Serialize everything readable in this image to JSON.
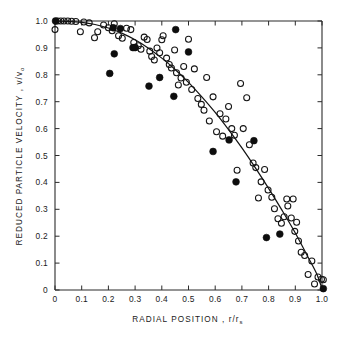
{
  "figure": {
    "background_color": "#ffffff",
    "ink_color": "#141414"
  },
  "chart_data": {
    "type": "scatter",
    "title": "",
    "xlabel": "RADIAL POSITION, r/r",
    "xlabel_main": "RADIAL POSITION ,",
    "xlabel_symbol": "r/r",
    "xlabel_subscript": "s",
    "ylabel_main": "REDUCED PARTICLE VELOCITY ,",
    "ylabel_symbol": "v/v",
    "ylabel_subscript": "o",
    "ylabel": "REDUCED PARTICLE VELOCITY, v/v_o",
    "xlim": [
      0,
      1.0
    ],
    "ylim": [
      0,
      1.0
    ],
    "grid": false,
    "legend": "none",
    "xticks": [
      0,
      0.1,
      0.2,
      0.3,
      0.4,
      0.5,
      0.6,
      0.7,
      0.8,
      0.9,
      1.0
    ],
    "xtick_labels": [
      "0",
      "0.1",
      "0.2",
      "0.3",
      "0.4",
      "0.5",
      "0.6",
      "0.7",
      "0.8",
      "0.9",
      "1.0"
    ],
    "yticks": [
      0,
      0.1,
      0.2,
      0.3,
      0.4,
      0.5,
      0.6,
      0.7,
      0.8,
      0.9,
      1.0
    ],
    "ytick_labels": [
      "0",
      "0.1",
      "0.2",
      "0.3",
      "0.4",
      "0.5",
      "0.6",
      "0.7",
      "0.8",
      "0.9",
      "1.0"
    ],
    "series": [
      {
        "name": "open-circles",
        "marker": "open circle",
        "marker_radius_px": 3.0,
        "color": "#141414",
        "points": [
          [
            0.0,
            0.968
          ],
          [
            0.01,
            1.0
          ],
          [
            0.022,
            1.0
          ],
          [
            0.034,
            1.0
          ],
          [
            0.048,
            1.0
          ],
          [
            0.062,
            0.999
          ],
          [
            0.078,
            0.998
          ],
          [
            0.095,
            0.96
          ],
          [
            0.108,
            0.996
          ],
          [
            0.128,
            0.993
          ],
          [
            0.148,
            0.938
          ],
          [
            0.16,
            0.96
          ],
          [
            0.182,
            0.985
          ],
          [
            0.2,
            0.975
          ],
          [
            0.214,
            0.964
          ],
          [
            0.222,
            0.99
          ],
          [
            0.238,
            0.945
          ],
          [
            0.252,
            0.936
          ],
          [
            0.268,
            0.973
          ],
          [
            0.284,
            0.968
          ],
          [
            0.295,
            0.92
          ],
          [
            0.3,
            0.901
          ],
          [
            0.312,
            0.908
          ],
          [
            0.322,
            0.895
          ],
          [
            0.334,
            0.94
          ],
          [
            0.345,
            0.931
          ],
          [
            0.355,
            0.888
          ],
          [
            0.362,
            0.868
          ],
          [
            0.372,
            0.855
          ],
          [
            0.382,
            0.9
          ],
          [
            0.392,
            0.882
          ],
          [
            0.4,
            0.93
          ],
          [
            0.405,
            0.945
          ],
          [
            0.418,
            0.862
          ],
          [
            0.428,
            0.838
          ],
          [
            0.436,
            0.825
          ],
          [
            0.448,
            0.892
          ],
          [
            0.455,
            0.808
          ],
          [
            0.462,
            0.762
          ],
          [
            0.472,
            0.788
          ],
          [
            0.482,
            0.831
          ],
          [
            0.492,
            0.772
          ],
          [
            0.5,
            0.932
          ],
          [
            0.512,
            0.745
          ],
          [
            0.522,
            0.822
          ],
          [
            0.535,
            0.712
          ],
          [
            0.548,
            0.69
          ],
          [
            0.558,
            0.668
          ],
          [
            0.568,
            0.79
          ],
          [
            0.578,
            0.628
          ],
          [
            0.592,
            0.718
          ],
          [
            0.605,
            0.588
          ],
          [
            0.618,
            0.655
          ],
          [
            0.628,
            0.572
          ],
          [
            0.64,
            0.636
          ],
          [
            0.65,
            0.682
          ],
          [
            0.662,
            0.6
          ],
          [
            0.672,
            0.575
          ],
          [
            0.682,
            0.445
          ],
          [
            0.695,
            0.768
          ],
          [
            0.705,
            0.6
          ],
          [
            0.718,
            0.715
          ],
          [
            0.728,
            0.54
          ],
          [
            0.742,
            0.472
          ],
          [
            0.752,
            0.455
          ],
          [
            0.762,
            0.342
          ],
          [
            0.772,
            0.402
          ],
          [
            0.785,
            0.448
          ],
          [
            0.798,
            0.372
          ],
          [
            0.812,
            0.345
          ],
          [
            0.822,
            0.302
          ],
          [
            0.835,
            0.265
          ],
          [
            0.848,
            0.248
          ],
          [
            0.858,
            0.272
          ],
          [
            0.868,
            0.338
          ],
          [
            0.872,
            0.312
          ],
          [
            0.885,
            0.268
          ],
          [
            0.892,
            0.338
          ],
          [
            0.898,
            0.218
          ],
          [
            0.905,
            0.252
          ],
          [
            0.912,
            0.182
          ],
          [
            0.922,
            0.14
          ],
          [
            0.935,
            0.128
          ],
          [
            0.948,
            0.058
          ],
          [
            0.962,
            0.108
          ],
          [
            0.972,
            0.022
          ],
          [
            0.985,
            0.048
          ],
          [
            0.998,
            0.04
          ],
          [
            1.005,
            0.038
          ]
        ]
      },
      {
        "name": "filled-circles",
        "marker": "filled circle",
        "marker_radius_px": 3.4,
        "color": "#0d0d0d",
        "points": [
          [
            0.002,
            1.0
          ],
          [
            0.205,
            0.805
          ],
          [
            0.218,
            0.975
          ],
          [
            0.222,
            0.878
          ],
          [
            0.245,
            0.972
          ],
          [
            0.292,
            0.901
          ],
          [
            0.3,
            0.902
          ],
          [
            0.352,
            0.758
          ],
          [
            0.392,
            0.79
          ],
          [
            0.445,
            0.72
          ],
          [
            0.452,
            0.968
          ],
          [
            0.5,
            0.885
          ],
          [
            0.592,
            0.515
          ],
          [
            0.652,
            0.558
          ],
          [
            0.678,
            0.402
          ],
          [
            0.745,
            0.555
          ],
          [
            0.792,
            0.195
          ],
          [
            0.842,
            0.208
          ],
          [
            1.005,
            0.005
          ]
        ]
      }
    ],
    "fit_curve": {
      "name": "fitted-curve",
      "color": "#141414",
      "points": [
        [
          0.0,
          1.0
        ],
        [
          0.05,
          0.999
        ],
        [
          0.1,
          0.995
        ],
        [
          0.15,
          0.987
        ],
        [
          0.2,
          0.974
        ],
        [
          0.25,
          0.955
        ],
        [
          0.3,
          0.93
        ],
        [
          0.35,
          0.899
        ],
        [
          0.4,
          0.862
        ],
        [
          0.45,
          0.82
        ],
        [
          0.5,
          0.772
        ],
        [
          0.55,
          0.718
        ],
        [
          0.6,
          0.66
        ],
        [
          0.65,
          0.596
        ],
        [
          0.7,
          0.528
        ],
        [
          0.75,
          0.455
        ],
        [
          0.8,
          0.378
        ],
        [
          0.85,
          0.297
        ],
        [
          0.9,
          0.212
        ],
        [
          0.95,
          0.118
        ],
        [
          0.98,
          0.06
        ],
        [
          1.0,
          0.005
        ]
      ]
    }
  }
}
